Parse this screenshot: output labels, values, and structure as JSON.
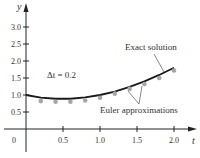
{
  "chart_data": {
    "type": "line",
    "title": "",
    "xlabel": "t",
    "ylabel": "y",
    "xlim": [
      0,
      2.2
    ],
    "ylim": [
      0,
      3.2
    ],
    "x_ticks": [
      "0",
      "0.5",
      "1.0",
      "1.5",
      "2.0"
    ],
    "y_ticks": [
      "0.5",
      "1.0",
      "1.5",
      "2.0",
      "2.5",
      "3.0"
    ],
    "grid": false,
    "annotations": {
      "step": "Δt = 0.2",
      "exact_label": "Exact solution",
      "euler_label": "Euler approximations"
    },
    "series": [
      {
        "name": "Exact solution",
        "style": "line",
        "color": "#1a1a1a",
        "x": [
          0,
          0.2,
          0.4,
          0.6,
          0.8,
          1.0,
          1.2,
          1.4,
          1.6,
          1.8,
          2.0
        ],
        "y": [
          1.0,
          0.92,
          0.89,
          0.89,
          0.93,
          1.0,
          1.1,
          1.24,
          1.4,
          1.59,
          1.8
        ]
      },
      {
        "name": "Euler approximations",
        "style": "points",
        "color": "#a6a6a6",
        "x": [
          0,
          0.2,
          0.4,
          0.6,
          0.8,
          1.0,
          1.2,
          1.4,
          1.6,
          1.8,
          2.0
        ],
        "y": [
          1.0,
          0.82,
          0.8,
          0.8,
          0.84,
          0.92,
          1.04,
          1.18,
          1.32,
          1.5,
          1.72
        ]
      }
    ]
  }
}
